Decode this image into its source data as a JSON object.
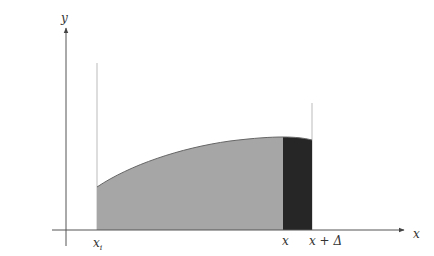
{
  "figure": {
    "type": "area-under-curve",
    "axes": {
      "x_label": "x",
      "y_label": "y"
    },
    "ticks": {
      "x_start": {
        "base": "x",
        "sub": "i"
      },
      "x": "x",
      "x_plus_delta": "x + Δ"
    },
    "regions": {
      "accumulated_area": {
        "color": "#a6a6a6"
      },
      "increment_strip": {
        "color": "#262626"
      }
    },
    "colors": {
      "axis": "#555555",
      "guide": "#bbbbbb",
      "curve": "#555555"
    }
  }
}
